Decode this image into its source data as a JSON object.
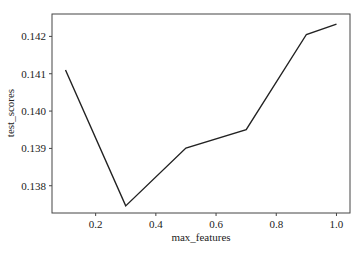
{
  "chart_data": {
    "type": "line",
    "title": "",
    "xlabel": "max_features",
    "ylabel": "test_scores",
    "x": [
      0.1,
      0.3,
      0.5,
      0.7,
      0.9,
      1.0
    ],
    "series": [
      {
        "name": "test_scores",
        "values": [
          0.1411,
          0.13746,
          0.13901,
          0.1395,
          0.14205,
          0.14233
        ]
      }
    ],
    "xticks": [
      0.2,
      0.4,
      0.6,
      0.8,
      1.0
    ],
    "xtick_labels": [
      "0.2",
      "0.4",
      "0.6",
      "0.8",
      "1.0"
    ],
    "yticks": [
      0.138,
      0.139,
      0.14,
      0.141,
      0.142
    ],
    "ytick_labels": [
      "0.138",
      "0.139",
      "0.140",
      "0.141",
      "0.142"
    ],
    "xlim": [
      0.055,
      1.045
    ],
    "ylim": [
      0.13727,
      0.1426
    ],
    "grid": false,
    "legend": null,
    "line_color": "#222222"
  }
}
